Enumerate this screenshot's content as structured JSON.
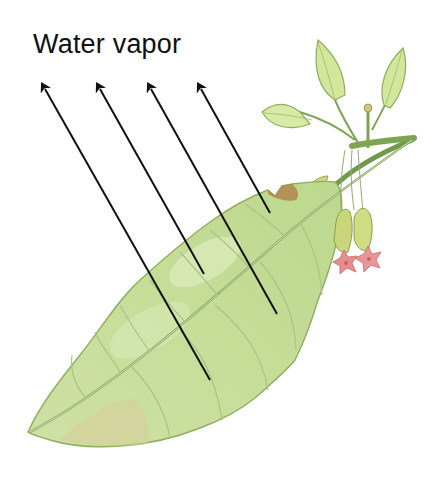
{
  "diagram": {
    "title": "Water vapor",
    "arrows": [
      {
        "id": "arrow-1",
        "from": [
          210,
          380
        ],
        "to": [
          40,
          80
        ]
      },
      {
        "id": "arrow-2",
        "from": [
          204,
          274
        ],
        "to": [
          95,
          80
        ]
      },
      {
        "id": "arrow-3",
        "from": [
          277,
          314
        ],
        "to": [
          146,
          80
        ]
      },
      {
        "id": "arrow-4",
        "from": [
          270,
          213
        ],
        "to": [
          196,
          80
        ]
      }
    ],
    "colors": {
      "leaf_fill": "#c8de9c",
      "leaf_light": "#dfecbc",
      "leaf_edge": "#8fae5e",
      "vein": "#a7c48a",
      "midrib": "#7fa55e",
      "brown_tint": "#c9b27e",
      "stem": "#6f9a4a",
      "young_leaf": "#cfe69a",
      "flower_bud": "#c9d77a",
      "flower_petal": "#e58e8e",
      "arrow": "#111111"
    }
  }
}
